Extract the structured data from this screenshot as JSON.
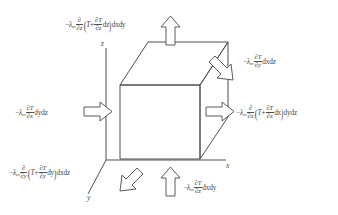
{
  "figure": {
    "kind": "heat-conduction-control-volume-diagram",
    "background_color": "#ffffff",
    "line_color": "#4f4f4e",
    "text_color": "#3f3f3f",
    "axes": {
      "x_label": "x",
      "y_label": "y",
      "z_label": "z"
    },
    "cube": {
      "description": "hexahedral control volume drawn in oblique projection",
      "front_face_corners": "(120,85) (200,85) (200,159) (120,159)",
      "depth_offset": "up-right"
    },
    "flux_labels": {
      "top": {
        "symbol_minus": "−",
        "lambda": "λ",
        "lambda_sub": "m",
        "operator_num": "∂",
        "operator_den": "∂z",
        "paren_open": "(",
        "T": "T",
        "plus": "+",
        "inner_num": "∂T",
        "inner_den": "∂z",
        "differential": "dz",
        "bracket_close": ")",
        "area": "dxdy",
        "full_text": "−λₘ ∂/∂z (T + ∂T/∂z dz) dxdy"
      },
      "right_top": {
        "symbol_minus": "−",
        "lambda": "λ",
        "lambda_sub": "m",
        "num": "∂T",
        "den": "∂y",
        "area": "dxdz",
        "full_text": "−λₘ ∂T/∂y dxdz"
      },
      "right_middle": {
        "symbol_minus": "−",
        "lambda": "λ",
        "lambda_sub": "m",
        "operator_num": "∂",
        "operator_den": "∂x",
        "paren_open": "(",
        "T": "T",
        "plus": "+",
        "inner_num": "∂T",
        "inner_den": "∂x",
        "differential": "dx",
        "bracket_close": ")",
        "area": "dydz",
        "full_text": "−λₘ ∂/∂x (T + ∂T/∂x dx) dydz"
      },
      "left_middle": {
        "symbol_minus": "−",
        "lambda": "λ",
        "lambda_sub": "m",
        "num": "∂T",
        "den": "∂x",
        "area": "dydz",
        "full_text": "−λₘ ∂T/∂x dydz"
      },
      "bottom_left": {
        "symbol_minus": "−",
        "lambda": "λ",
        "lambda_sub": "m",
        "operator_num": "∂",
        "operator_den": "∂y",
        "paren_open": "(",
        "T": "T",
        "plus": "+",
        "inner_num": "∂T",
        "inner_den": "∂y",
        "differential": "dy",
        "bracket_close": ")",
        "area": "dxdz",
        "full_text": "−λₘ ∂/∂y (T + ∂T/∂y dy) dxdz"
      },
      "bottom_center": {
        "symbol_minus": "−",
        "lambda": "λ",
        "lambda_sub": "m",
        "num": "∂T",
        "den": "∂z",
        "area": "dxdy",
        "full_text": "−λₘ ∂T/∂z dxdy"
      }
    },
    "arrows": [
      {
        "name": "arrow-top-out",
        "direction": "up",
        "style": "hollow-outline"
      },
      {
        "name": "arrow-right-top-in",
        "direction": "down-right",
        "style": "hollow-outline"
      },
      {
        "name": "arrow-right-middle-out",
        "direction": "right",
        "style": "hollow-outline"
      },
      {
        "name": "arrow-left-middle-in",
        "direction": "right",
        "style": "hollow-outline"
      },
      {
        "name": "arrow-bottom-left-out",
        "direction": "down-left",
        "style": "hollow-outline"
      },
      {
        "name": "arrow-bottom-center-in",
        "direction": "up",
        "style": "hollow-outline"
      }
    ]
  }
}
